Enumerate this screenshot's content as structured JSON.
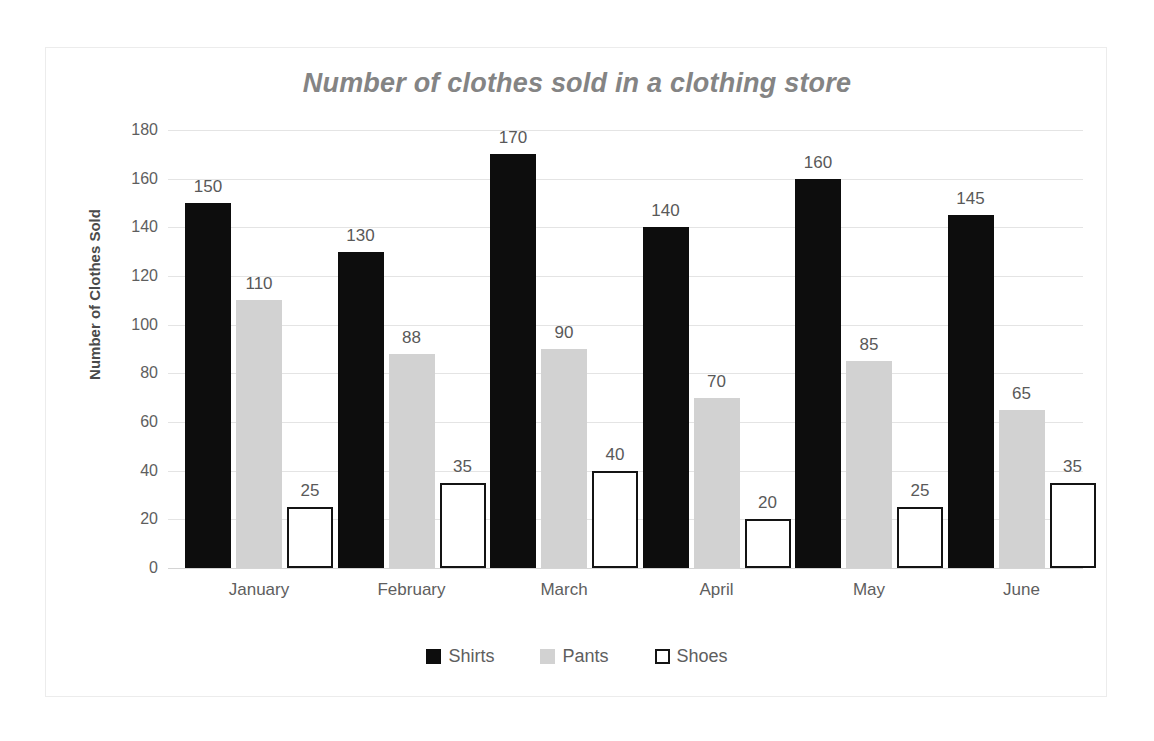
{
  "chart_data": {
    "type": "bar",
    "title": "Number of clothes sold in a clothing store",
    "xlabel": "",
    "ylabel": "Number of Clothes Sold",
    "ylim": [
      0,
      180
    ],
    "ytick_step": 20,
    "yticks": [
      180,
      160,
      140,
      120,
      100,
      80,
      60,
      40,
      20,
      0
    ],
    "categories": [
      "January",
      "February",
      "March",
      "April",
      "May",
      "June"
    ],
    "series": [
      {
        "name": "Shirts",
        "color": "#0d0d0d",
        "values": [
          150,
          130,
          170,
          140,
          160,
          145
        ]
      },
      {
        "name": "Pants",
        "color": "#d2d2d2",
        "values": [
          110,
          88,
          90,
          70,
          85,
          65
        ]
      },
      {
        "name": "Shoes",
        "color": "#ffffff",
        "values": [
          25,
          35,
          40,
          20,
          25,
          35
        ]
      }
    ],
    "data_labels": true,
    "grid": true,
    "legend_position": "bottom"
  },
  "legend": {
    "items": [
      {
        "label": "Shirts",
        "swatch": "black-square-icon"
      },
      {
        "label": "Pants",
        "swatch": "gray-square-icon"
      },
      {
        "label": "Shoes",
        "swatch": "outlined-square-icon"
      }
    ]
  }
}
